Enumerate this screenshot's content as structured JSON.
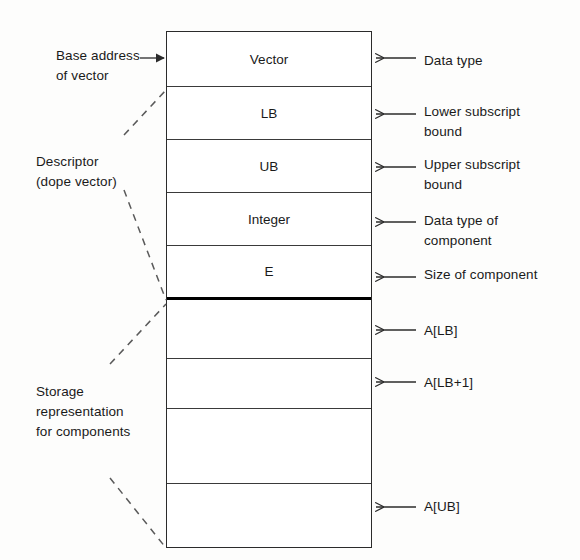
{
  "diagram": {
    "ink_color": "#1a1a1a",
    "line_color": "#2b2b2b",
    "background": "#fdfdfc"
  },
  "left_labels": [
    {
      "id": "base-address",
      "text": "Base address\nof vector",
      "x": 56,
      "y": 46
    },
    {
      "id": "descriptor",
      "text": "Descriptor\n(dope vector)",
      "x": 36,
      "y": 152
    },
    {
      "id": "storage-representation",
      "text": "Storage\nrepresentation\nfor components",
      "x": 36,
      "y": 382
    }
  ],
  "right_labels": [
    {
      "id": "data-type",
      "text": "Data type",
      "x": 424,
      "y": 51
    },
    {
      "id": "lower-subscript-bound",
      "text": "Lower subscript\nbound",
      "x": 424,
      "y": 102
    },
    {
      "id": "upper-subscript-bound",
      "text": "Upper subscript\nbound",
      "x": 424,
      "y": 155
    },
    {
      "id": "data-type-of-component",
      "text": "Data type of\ncomponent",
      "x": 424,
      "y": 211
    },
    {
      "id": "size-of-component",
      "text": "Size of component",
      "x": 424,
      "y": 265
    },
    {
      "id": "element-lb",
      "text": "A[LB]",
      "x": 424,
      "y": 321
    },
    {
      "id": "element-lb-plus-1",
      "text": "A[LB+1]",
      "x": 424,
      "y": 373
    },
    {
      "id": "element-ub",
      "text": "A[UB]",
      "x": 424,
      "y": 497
    }
  ],
  "cells": [
    {
      "id": "cell-vector",
      "label": "Vector",
      "top": 0,
      "height": 55,
      "thick_bottom": false
    },
    {
      "id": "cell-lb",
      "label": "LB",
      "top": 55,
      "height": 53,
      "thick_bottom": false
    },
    {
      "id": "cell-ub",
      "label": "UB",
      "top": 108,
      "height": 53,
      "thick_bottom": false
    },
    {
      "id": "cell-integer",
      "label": "Integer",
      "top": 161,
      "height": 53,
      "thick_bottom": false
    },
    {
      "id": "cell-e",
      "label": "E",
      "top": 214,
      "height": 54,
      "thick_bottom": true
    },
    {
      "id": "cell-elem-1",
      "label": "",
      "top": 268,
      "height": 59,
      "thick_bottom": false
    },
    {
      "id": "cell-elem-2",
      "label": "",
      "top": 327,
      "height": 50,
      "thick_bottom": false
    },
    {
      "id": "cell-elem-gap",
      "label": "",
      "top": 377,
      "height": 75,
      "thick_bottom": false
    },
    {
      "id": "cell-elem-last",
      "label": "",
      "top": 452,
      "height": 63,
      "thick_bottom": false
    }
  ],
  "arrows": {
    "base_address": {
      "from_x": 140,
      "to_x": 164,
      "y": 58,
      "direction": "right"
    },
    "right_arrows": [
      {
        "id": "arrow-data-type",
        "y": 58,
        "from_x": 416,
        "to_x": 376
      },
      {
        "id": "arrow-lower-bound",
        "y": 114,
        "from_x": 416,
        "to_x": 376
      },
      {
        "id": "arrow-upper-bound",
        "y": 167,
        "from_x": 416,
        "to_x": 376
      },
      {
        "id": "arrow-component-type",
        "y": 222,
        "from_x": 416,
        "to_x": 376
      },
      {
        "id": "arrow-component-size",
        "y": 277,
        "from_x": 416,
        "to_x": 376
      },
      {
        "id": "arrow-elem-lb",
        "y": 330,
        "from_x": 416,
        "to_x": 376
      },
      {
        "id": "arrow-elem-lb-plus-1",
        "y": 382,
        "from_x": 416,
        "to_x": 376
      },
      {
        "id": "arrow-elem-ub",
        "y": 507,
        "from_x": 416,
        "to_x": 376
      }
    ]
  },
  "braces": [
    {
      "id": "brace-descriptor-top",
      "x1": 124,
      "y1": 135,
      "x2": 166,
      "y2": 90
    },
    {
      "id": "brace-descriptor-bot",
      "x1": 124,
      "y1": 190,
      "x2": 166,
      "y2": 300
    },
    {
      "id": "brace-storage-top",
      "x1": 110,
      "y1": 364,
      "x2": 166,
      "y2": 304
    },
    {
      "id": "brace-storage-bot",
      "x1": 110,
      "y1": 478,
      "x2": 166,
      "y2": 548
    }
  ]
}
